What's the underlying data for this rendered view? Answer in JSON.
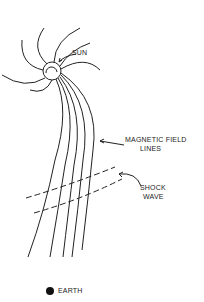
{
  "diagram": {
    "labels": {
      "sun": "SUN",
      "magnetic_field_line1": "MAGNETIC FIELD",
      "magnetic_field_line2": "LINES",
      "shock_line1": "SHOCK",
      "shock_line2": "WAVE",
      "earth": "EARTH"
    },
    "colors": {
      "ink": "#222222",
      "background": "#ffffff"
    }
  }
}
